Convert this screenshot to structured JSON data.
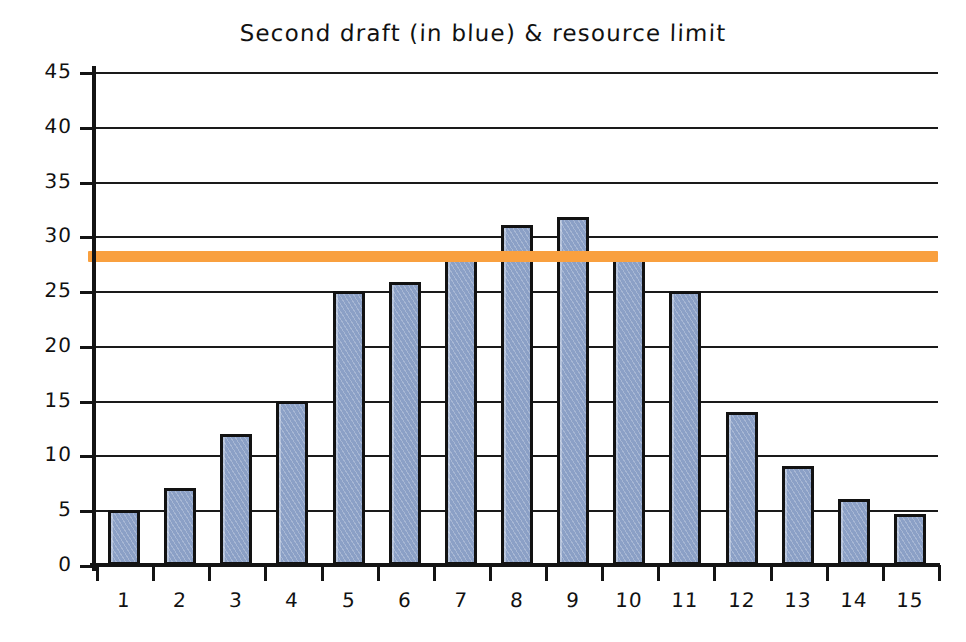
{
  "chart_data": {
    "type": "bar",
    "title": "Second draft (in blue) & resource limit",
    "xlabel": "",
    "ylabel": "",
    "categories": [
      "1",
      "2",
      "3",
      "4",
      "5",
      "6",
      "7",
      "8",
      "9",
      "10",
      "11",
      "12",
      "13",
      "14",
      "15"
    ],
    "values": [
      5,
      7,
      12,
      15,
      25,
      25.8,
      28.5,
      31,
      31.8,
      28.5,
      25,
      14,
      9,
      6,
      4.7
    ],
    "series": [
      {
        "name": "Second draft",
        "color": "#8ba0c6",
        "values": [
          5,
          7,
          12,
          15,
          25,
          25.8,
          28.5,
          31,
          31.8,
          28.5,
          25,
          14,
          9,
          6,
          4.7
        ]
      }
    ],
    "reference_lines": [
      {
        "name": "resource limit",
        "value": 28.2,
        "color": "#f9a03f",
        "orientation": "horizontal"
      }
    ],
    "ylim": [
      0,
      45
    ],
    "yticks": [
      0,
      5,
      10,
      15,
      20,
      25,
      30,
      35,
      40,
      45
    ],
    "ytick_labels": [
      "0",
      "5",
      "10",
      "15",
      "20",
      "25",
      "30",
      "35",
      "40",
      "45"
    ],
    "xtick_labels": [
      "1",
      "2",
      "3",
      "4",
      "5",
      "6",
      "7",
      "8",
      "9",
      "10",
      "11",
      "12",
      "13",
      "14",
      "15"
    ],
    "grid": "horizontal",
    "legend": "none",
    "style": "hand-drawn",
    "annotations": []
  },
  "colors": {
    "bar_fill": "#8ba0c6",
    "bar_stroke": "#121212",
    "limit_line": "#f9a03f",
    "axis": "#141414",
    "grid": "#1a1a1a",
    "background": "#ffffff",
    "text": "#111111"
  }
}
